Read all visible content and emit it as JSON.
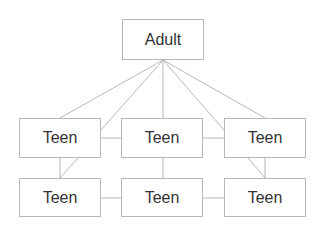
{
  "diagram": {
    "nodes": [
      {
        "id": "adult",
        "label": "Adult",
        "x": 122,
        "y": 19,
        "w": 82,
        "h": 41
      },
      {
        "id": "teen-1",
        "label": "Teen",
        "x": 19,
        "y": 118,
        "w": 82,
        "h": 40
      },
      {
        "id": "teen-2",
        "label": "Teen",
        "x": 121,
        "y": 118,
        "w": 82,
        "h": 40
      },
      {
        "id": "teen-3",
        "label": "Teen",
        "x": 224,
        "y": 118,
        "w": 82,
        "h": 40
      },
      {
        "id": "teen-4",
        "label": "Teen",
        "x": 19,
        "y": 178,
        "w": 82,
        "h": 39
      },
      {
        "id": "teen-5",
        "label": "Teen",
        "x": 121,
        "y": 178,
        "w": 82,
        "h": 39
      },
      {
        "id": "teen-6",
        "label": "Teen",
        "x": 224,
        "y": 178,
        "w": 82,
        "h": 39
      }
    ],
    "edges": [
      {
        "from": "adult",
        "to": "teen-1"
      },
      {
        "from": "adult",
        "to": "teen-1"
      },
      {
        "from": "adult",
        "to": "teen-2"
      },
      {
        "from": "adult",
        "to": "teen-3"
      },
      {
        "from": "adult",
        "to": "teen-3"
      },
      {
        "from": "teen-1",
        "to": "teen-2"
      },
      {
        "from": "teen-2",
        "to": "teen-3"
      },
      {
        "from": "teen-1",
        "to": "teen-4"
      },
      {
        "from": "teen-1",
        "to": "teen-4"
      },
      {
        "from": "teen-2",
        "to": "teen-5"
      },
      {
        "from": "teen-3",
        "to": "teen-6"
      },
      {
        "from": "teen-3",
        "to": "teen-6"
      },
      {
        "from": "teen-4",
        "to": "teen-5"
      },
      {
        "from": "teen-5",
        "to": "teen-6"
      }
    ],
    "colors": {
      "line": "#b8b8b8",
      "border": "#b8b8b8",
      "text": "#333333"
    }
  }
}
